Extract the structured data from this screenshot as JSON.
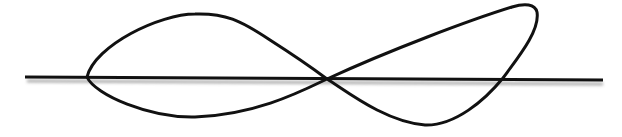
{
  "figure": {
    "colors": {
      "background": "#ffffff",
      "stroke": "#111111",
      "shadow": "#9a9a9a"
    },
    "baseline": {
      "x1": 25,
      "y1": 77,
      "x2": 603,
      "y2": 80,
      "stroke_width": 3
    },
    "curve": {
      "stroke_width": 3
    }
  }
}
